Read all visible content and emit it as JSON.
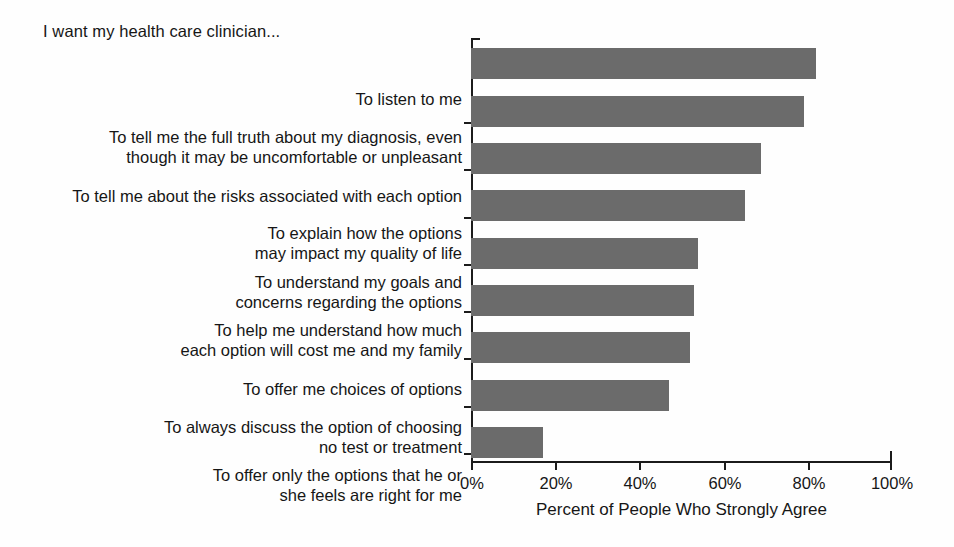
{
  "chart_data": {
    "type": "bar",
    "orientation": "horizontal",
    "title": "I want my health care clinician...",
    "xlabel": "Percent of People Who Strongly Agree",
    "ylabel": "",
    "xlim": [
      0,
      100
    ],
    "xticks": [
      0,
      20,
      40,
      60,
      80,
      100
    ],
    "xtick_labels": [
      "0%",
      "20%",
      "40%",
      "60%",
      "80%",
      "100%"
    ],
    "grid": false,
    "legend": null,
    "bar_color": "#6b6b6b",
    "axis_color": "#1b1b1b",
    "categories": [
      "To listen to me",
      "To tell me the full truth about my diagnosis, even\nthough it may be uncomfortable or unpleasant",
      "To tell me about the risks associated with each option",
      "To explain how the options\nmay impact my quality of life",
      "To understand my goals and\nconcerns regarding the options",
      "To help me understand how much\neach option will cost me and my family",
      "To offer me choices of options",
      "To always discuss the option of choosing\nno test or treatment",
      "To offer only the options that he or\nshe feels are right for me"
    ],
    "values": [
      82,
      79,
      69,
      65,
      54,
      53,
      52,
      47,
      17
    ]
  }
}
